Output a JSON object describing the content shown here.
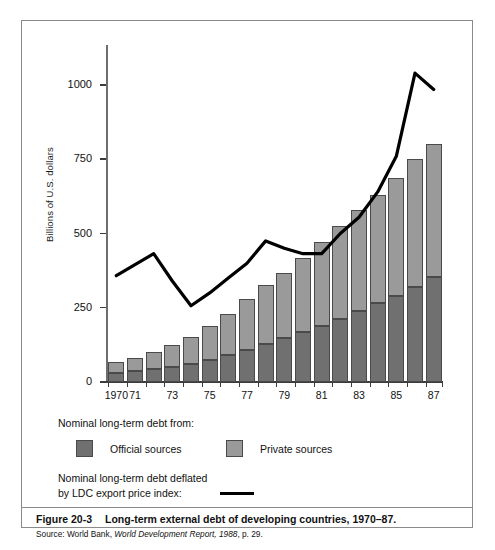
{
  "figure": {
    "number_label": "Figure 20-3",
    "title": "Long-term external debt of developing countries, 1970–87.",
    "source_prefix": "Source: World Bank, ",
    "source_italic": "World Development Report, 1988",
    "source_suffix": ", p. 29."
  },
  "legend": {
    "heading": "Nominal long-term debt from:",
    "official_label": "Official sources",
    "private_label": "Private sources",
    "line_label_line1": "Nominal long-term debt deflated",
    "line_label_line2": "by LDC export price index:",
    "official_color": "#707070",
    "private_color": "#9a9a9a",
    "line_color": "#000000"
  },
  "chart_data": {
    "type": "bar",
    "subtype": "stacked-bar-with-line-overlay",
    "title": "Long-term external debt of developing countries, 1970–87.",
    "xlabel": "",
    "ylabel": "Billions of U.S. dollars",
    "ylim": [
      0,
      1100
    ],
    "ytick_values": [
      0,
      250,
      500,
      750,
      1000
    ],
    "ytick_labels": [
      "0",
      "250",
      "500",
      "750",
      "1000"
    ],
    "grid": false,
    "legend_position": "below-plot",
    "categories": [
      1970,
      1971,
      1972,
      1973,
      1974,
      1975,
      1976,
      1977,
      1978,
      1979,
      1980,
      1981,
      1982,
      1983,
      1984,
      1985,
      1986,
      1987
    ],
    "xtick_labels": [
      "1970",
      "",
      "",
      "73",
      "",
      "75",
      "",
      "77",
      "",
      "79",
      "",
      "81",
      "",
      "83",
      "",
      "85",
      "",
      "87"
    ],
    "xtick_labels_shown": [
      "1970",
      "71",
      "73",
      "75",
      "77",
      "79",
      "81",
      "83",
      "85",
      "87"
    ],
    "series": [
      {
        "name": "Official sources",
        "color": "#707070",
        "values": [
          30,
          36,
          43,
          52,
          62,
          75,
          90,
          108,
          128,
          148,
          168,
          190,
          212,
          238,
          265,
          288,
          320,
          355
        ]
      },
      {
        "name": "Private sources",
        "color": "#9a9a9a",
        "values": [
          37,
          46,
          57,
          73,
          90,
          115,
          140,
          170,
          200,
          220,
          250,
          280,
          315,
          340,
          365,
          400,
          430,
          445
        ]
      },
      {
        "name": "Total nominal long-term debt",
        "type": "stack-total",
        "values": [
          67,
          82,
          100,
          125,
          152,
          190,
          230,
          278,
          328,
          368,
          418,
          470,
          527,
          578,
          630,
          688,
          750,
          800
        ]
      },
      {
        "name": "Nominal long-term debt deflated by LDC export price index",
        "type": "line",
        "color": "#000000",
        "values": [
          358,
          395,
          432,
          340,
          257,
          300,
          350,
          400,
          475,
          450,
          432,
          432,
          500,
          555,
          640,
          760,
          1040,
          985
        ]
      }
    ]
  },
  "axis": {
    "y_title": "Billions of U.S. dollars"
  }
}
